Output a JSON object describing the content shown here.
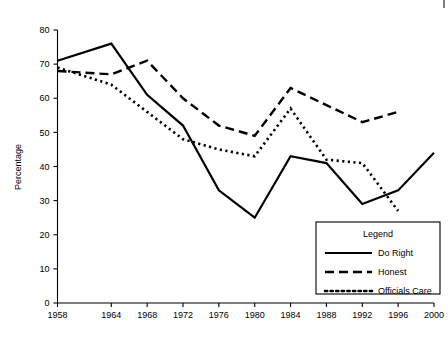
{
  "chart_data": {
    "type": "line",
    "title": "",
    "xlabel": "",
    "ylabel": "Percentage",
    "ylim": [
      0,
      80
    ],
    "yticks": [
      0,
      10,
      20,
      30,
      40,
      50,
      60,
      70,
      80
    ],
    "grid": false,
    "legend_position": "bottom-right",
    "legend_title": "Legend",
    "x": [
      1958,
      1964,
      1968,
      1972,
      1976,
      1980,
      1984,
      1988,
      1992,
      1996,
      2000
    ],
    "xtick_labels": [
      "1958",
      "1964",
      "1968",
      "1972",
      "1976",
      "1980",
      "1984",
      "1988",
      "1992",
      "1996",
      "2000"
    ],
    "series": [
      {
        "name": "Do Right",
        "style": "solid",
        "x": [
          1958,
          1964,
          1968,
          1972,
          1976,
          1980,
          1984,
          1988,
          1992,
          1996,
          2000
        ],
        "values": [
          71,
          76,
          61,
          52,
          33,
          25,
          43,
          41,
          29,
          33,
          44
        ]
      },
      {
        "name": "Honest",
        "style": "dashed",
        "x": [
          1958,
          1964,
          1968,
          1972,
          1976,
          1980,
          1984,
          1988,
          1992,
          1996
        ],
        "values": [
          68,
          67,
          71,
          60,
          52,
          49,
          63,
          58,
          53,
          56
        ]
      },
      {
        "name": "Officials Care",
        "style": "dotted",
        "x": [
          1958,
          1964,
          1968,
          1972,
          1976,
          1980,
          1984,
          1988,
          1992,
          1996
        ],
        "values": [
          69,
          64,
          56,
          48,
          45,
          43,
          57,
          42,
          41,
          27
        ]
      }
    ]
  },
  "axis": {
    "y_title": "Percentage",
    "y_tick_labels": [
      "0",
      "10",
      "20",
      "30",
      "40",
      "50",
      "60",
      "70",
      "80"
    ],
    "x_tick_labels": [
      "1958",
      "1964",
      "1968",
      "1972",
      "1976",
      "1980",
      "1984",
      "1988",
      "1992",
      "1996",
      "2000"
    ]
  },
  "legend": {
    "title": "Legend",
    "entries": [
      {
        "label": "Do Right",
        "style": "solid"
      },
      {
        "label": "Honest",
        "style": "dashed"
      },
      {
        "label": "Officials Care",
        "style": "dotted"
      }
    ]
  },
  "colors": {
    "ink": "#000000",
    "background": "#ffffff"
  }
}
